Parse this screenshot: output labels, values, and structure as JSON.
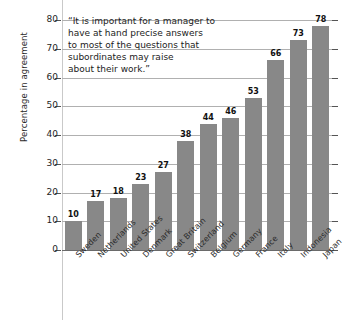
{
  "chart_data": {
    "type": "bar",
    "title": "",
    "annotation": "“It is important for a manager to have at hand precise answers to most of the questions that subordinates may raise about their work.”",
    "annotation_lines": [
      "“It is important for a manager to",
      "have at hand precise answers",
      "to most of the questions that",
      "subordinates may raise",
      "about their work.”"
    ],
    "categories": [
      "Sweden",
      "Netherlands",
      "United States",
      "Denmark",
      "Great Britain",
      "Switzerland",
      "Belgium",
      "Germany",
      "France",
      "Italy",
      "Indonesia",
      "Japan"
    ],
    "values": [
      10,
      17,
      18,
      23,
      27,
      38,
      44,
      46,
      53,
      66,
      73,
      78
    ],
    "xlabel": "",
    "ylabel": "Percentage in agreement",
    "ylim": [
      0,
      80
    ],
    "ytick_labels": [
      "0",
      "10",
      "20",
      "30",
      "40",
      "50",
      "60",
      "70",
      "80"
    ],
    "yticks": [
      0,
      10,
      20,
      30,
      40,
      50,
      60,
      70,
      80
    ],
    "grid": true,
    "legend": false,
    "bar_color": "#888888",
    "gridline_color": "#b0b0b0",
    "axis_color": "#6a6a6a",
    "text_color": "#1c1c1c"
  }
}
